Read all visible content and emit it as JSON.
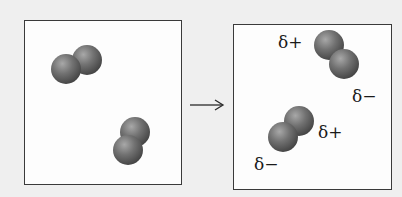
{
  "diagram": {
    "panels": [
      {
        "id": "before",
        "molecules": [
          {
            "atoms": [
              {
                "cx": 66,
                "cy": 69,
                "r": 15
              },
              {
                "cx": 87,
                "cy": 60,
                "r": 15
              }
            ]
          },
          {
            "atoms": [
              {
                "cx": 135,
                "cy": 132,
                "r": 15
              },
              {
                "cx": 128,
                "cy": 150,
                "r": 15
              }
            ]
          }
        ]
      },
      {
        "id": "after",
        "molecules": [
          {
            "atoms": [
              {
                "cx": 329,
                "cy": 45,
                "r": 15
              },
              {
                "cx": 344,
                "cy": 64,
                "r": 15
              }
            ],
            "labels": {
              "positive": "δ+",
              "negative": "δ−"
            }
          },
          {
            "atoms": [
              {
                "cx": 299,
                "cy": 121,
                "r": 15
              },
              {
                "cx": 283,
                "cy": 137,
                "r": 15
              }
            ],
            "labels": {
              "positive": "δ+",
              "negative": "δ−"
            }
          }
        ]
      }
    ],
    "arrow": {
      "symbol": "→",
      "meaning": "transforms-to"
    },
    "labels": {
      "after_mol1_positive": "δ+",
      "after_mol1_negative": "δ−",
      "after_mol2_positive": "δ+",
      "after_mol2_negative": "δ−"
    },
    "colors": {
      "atom_light": "#9a9a9a",
      "atom_mid": "#6e6e6e",
      "atom_dark": "#3e3e3e",
      "border": "#3a3a3a",
      "background": "#efefef",
      "panel": "#fdfdfd"
    }
  }
}
